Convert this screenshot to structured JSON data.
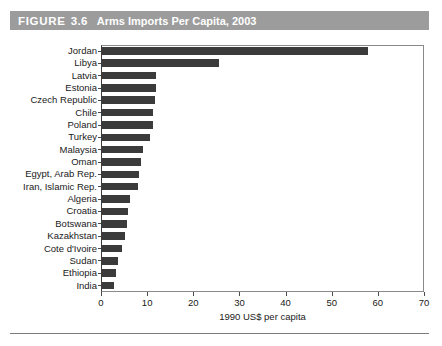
{
  "figure": {
    "label_word": "FIGURE",
    "number": "3.6",
    "caption": "Arms Imports Per Capita, 2003",
    "titlebar_color": "#9c9c9c",
    "title_text_color": "#ffffff"
  },
  "chart_data": {
    "type": "bar",
    "orientation": "horizontal",
    "title": "Arms Imports Per Capita, 2003",
    "xlabel": "1990 US$ per capita",
    "ylabel": "",
    "xlim": [
      0,
      70
    ],
    "xticks": [
      0,
      10,
      20,
      30,
      40,
      50,
      60,
      70
    ],
    "xtick_labels": [
      "0",
      "10",
      "20",
      "30",
      "40",
      "50",
      "60",
      "70"
    ],
    "grid": false,
    "legend": null,
    "bar_color": "#3b3b3b",
    "categories": [
      "Jordan",
      "Libya",
      "Latvia",
      "Estonia",
      "Czech Republic",
      "Chile",
      "Poland",
      "Turkey",
      "Malaysia",
      "Oman",
      "Egypt, Arab Rep.",
      "Iran, Islamic Rep.",
      "Algeria",
      "Croatia",
      "Botswana",
      "Kazakhstan",
      "Cote d'Ivoire",
      "Sudan",
      "Ethiopia",
      "India"
    ],
    "values": [
      57.9,
      25.6,
      12.0,
      11.9,
      11.8,
      11.3,
      11.2,
      10.6,
      9.1,
      8.7,
      8.2,
      8.0,
      6.3,
      5.8,
      5.6,
      5.2,
      4.6,
      3.7,
      3.3,
      2.8
    ]
  },
  "bottom_rule": {
    "color": "#7d7d7d"
  }
}
